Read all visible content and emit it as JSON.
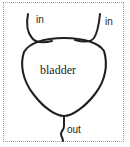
{
  "figure": {
    "border_style": "dotted",
    "border_color": "#9a9a9a",
    "stroke_color": "#231f20",
    "background_color": "#ffffff"
  },
  "labels": {
    "inlet_left": "in",
    "inlet_right": "in",
    "body": "bladder",
    "outlet": "out"
  },
  "geometry": {
    "body_path": "M 24 52 C 20 64, 22 80, 34 95 C 44 108, 56 116, 64 116 C 72 116, 85 107, 95 94 C 106 80, 108 64, 104 51 C 99 43, 84 38, 64 38 C 44 38, 29 43, 24 52 Z",
    "inlet_left_path": "M 28 14 C 26 24, 27 32, 32 38 C 36 43, 44 43, 52 41",
    "inlet_right_path": "M 100 14 C 99 24, 98 32, 94 38 C 90 43, 82 42, 75 40",
    "outlet_path": "M 64 116 L 64 126 C 64 130, 61 131, 61 134 C 61 137, 63 138, 63 141"
  }
}
